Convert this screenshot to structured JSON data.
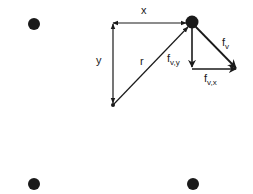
{
  "diagram": {
    "colors": {
      "ink": "#1a1a1a",
      "background": "#ffffff"
    },
    "nodes": [
      {
        "id": "vortex-top-left",
        "cx": 34,
        "cy": 24,
        "r": 6
      },
      {
        "id": "vortex-top-right",
        "cx": 192,
        "cy": 22,
        "r": 6
      },
      {
        "id": "vortex-bottom-left",
        "cx": 34,
        "cy": 184,
        "r": 6
      },
      {
        "id": "vortex-bottom-right",
        "cx": 193,
        "cy": 184,
        "r": 6
      },
      {
        "id": "target-point",
        "cx": 113,
        "cy": 105,
        "r": 2
      }
    ],
    "labels": {
      "x": "x",
      "y": "y",
      "r": "r",
      "fv_base": "f",
      "fv_sub": "v",
      "fvy_base": "f",
      "fvy_sub": "v,y",
      "fvx_base": "f",
      "fvx_sub": "v,x"
    },
    "edges": [
      {
        "id": "x-offset",
        "from": "corner",
        "to": "vortex-top-right",
        "arrows": "both",
        "label": "x"
      },
      {
        "id": "y-offset",
        "from": "corner",
        "to": "target-point",
        "arrows": "both",
        "label": "y"
      },
      {
        "id": "r-vector",
        "from": "target-point",
        "to": "vortex-top-right",
        "arrows": "end",
        "label": "r"
      },
      {
        "id": "fv",
        "from": "vortex-top-right",
        "to": "fv-tip",
        "arrows": "end",
        "label": "f_v"
      },
      {
        "id": "fv-y",
        "from": "vortex-top-right",
        "to": "fv-corner",
        "arrows": "end",
        "label": "f_v,y"
      },
      {
        "id": "fv-x",
        "from": "fv-corner",
        "to": "fv-tip",
        "arrows": "end",
        "label": "f_v,x"
      }
    ]
  }
}
